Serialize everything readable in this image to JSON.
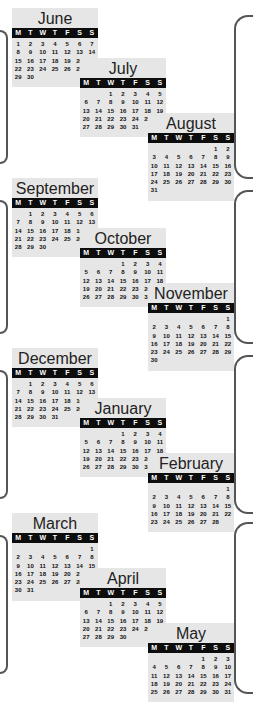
{
  "weekday_headers": [
    "M",
    "T",
    "W",
    "T",
    "F",
    "S",
    "S"
  ],
  "colors": {
    "header_bg": "#0d0d0d",
    "box_bg": "#e6e6e6",
    "bracket": "#555555"
  },
  "months": [
    {
      "name": "June",
      "offset": 0,
      "days": 30
    },
    {
      "name": "July",
      "offset": 2,
      "days": 31
    },
    {
      "name": "August",
      "offset": 5,
      "days": 31
    },
    {
      "name": "September",
      "offset": 1,
      "days": 30
    },
    {
      "name": "October",
      "offset": 3,
      "days": 31
    },
    {
      "name": "November",
      "offset": 6,
      "days": 30
    },
    {
      "name": "December",
      "offset": 1,
      "days": 31
    },
    {
      "name": "January",
      "offset": 3,
      "days": 31
    },
    {
      "name": "February",
      "offset": 6,
      "days": 28
    },
    {
      "name": "March",
      "offset": 6,
      "days": 31
    },
    {
      "name": "April",
      "offset": 2,
      "days": 30
    },
    {
      "name": "May",
      "offset": 4,
      "days": 31
    }
  ]
}
